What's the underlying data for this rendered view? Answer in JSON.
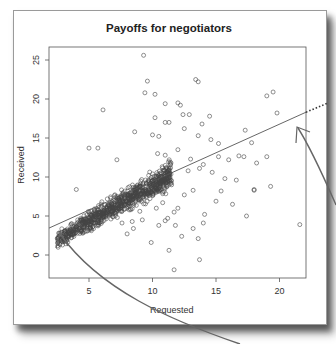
{
  "chart_data": {
    "type": "scatter",
    "title": "Payoffs for negotiators",
    "xlabel": "Requested",
    "ylabel": "Received",
    "xlim": [
      1.85,
      22.2
    ],
    "ylim": [
      -3,
      26.5
    ],
    "x_ticks": [
      5,
      10,
      15,
      20
    ],
    "y_ticks": [
      0,
      5,
      10,
      15,
      20,
      25
    ],
    "grid": false,
    "legend": null,
    "regression_line": {
      "slope": 0.73,
      "intercept": 2.1,
      "extended_dotted": true
    },
    "annotations": [
      {
        "type": "arrow",
        "points_to": "regression line left end",
        "at": [
          2.8,
          3.0
        ]
      },
      {
        "type": "arrow",
        "points_to": "regression line right end",
        "at": [
          21.5,
          16.3
        ]
      }
    ],
    "cluster": {
      "description": "dense band of ~900 points along regression line",
      "x_range": [
        2.5,
        11.5
      ],
      "slope": 0.95,
      "intercept": -0.5,
      "spread": 0.55,
      "count": 900
    },
    "outliers": [
      [
        9.3,
        25.6
      ],
      [
        6.1,
        18.6
      ],
      [
        5.0,
        13.7
      ],
      [
        5.7,
        13.7
      ],
      [
        7.2,
        12.2
      ],
      [
        9.6,
        22.3
      ],
      [
        9.4,
        20.8
      ],
      [
        10.2,
        20.6
      ],
      [
        11.0,
        19.4
      ],
      [
        12.0,
        19.5
      ],
      [
        12.2,
        19.2
      ],
      [
        13.4,
        22.5
      ],
      [
        13.6,
        22.2
      ],
      [
        19.5,
        20.9
      ],
      [
        19.0,
        20.4
      ],
      [
        19.8,
        18.2
      ],
      [
        12.4,
        18.0
      ],
      [
        12.9,
        18.0
      ],
      [
        13.9,
        16.8
      ],
      [
        14.5,
        17.8
      ],
      [
        11.0,
        17.0
      ],
      [
        11.3,
        17.0
      ],
      [
        10.2,
        17.6
      ],
      [
        8.6,
        15.8
      ],
      [
        10.0,
        15.4
      ],
      [
        10.5,
        15.2
      ],
      [
        12.5,
        16.2
      ],
      [
        13.6,
        15.3
      ],
      [
        14.6,
        14.8
      ],
      [
        15.2,
        14.3
      ],
      [
        17.3,
        16.0
      ],
      [
        17.8,
        14.4
      ],
      [
        15.2,
        12.6
      ],
      [
        16.0,
        12.2
      ],
      [
        16.8,
        12.7
      ],
      [
        17.2,
        12.6
      ],
      [
        18.2,
        11.8
      ],
      [
        19.0,
        12.6
      ],
      [
        10.4,
        13.0
      ],
      [
        11.0,
        12.8
      ],
      [
        12.0,
        13.5
      ],
      [
        13.0,
        12.3
      ],
      [
        14.0,
        11.6
      ],
      [
        14.7,
        10.6
      ],
      [
        15.7,
        9.8
      ],
      [
        16.6,
        9.6
      ],
      [
        18.0,
        8.3
      ],
      [
        18.0,
        8.4
      ],
      [
        19.3,
        8.8
      ],
      [
        21.6,
        3.9
      ],
      [
        15.0,
        6.9
      ],
      [
        15.4,
        8.2
      ],
      [
        13.2,
        8.3
      ],
      [
        12.5,
        7.7
      ],
      [
        12.0,
        6.0
      ],
      [
        11.7,
        5.5
      ],
      [
        11.8,
        3.8
      ],
      [
        11.2,
        4.7
      ],
      [
        12.3,
        2.4
      ],
      [
        11.3,
        0.6
      ],
      [
        10.3,
        6.0
      ],
      [
        9.2,
        4.5
      ],
      [
        8.5,
        3.4
      ],
      [
        8.0,
        2.7
      ],
      [
        9.9,
        1.6
      ],
      [
        13.7,
        -0.6
      ],
      [
        10.5,
        3.8
      ],
      [
        8.4,
        4.3
      ],
      [
        7.6,
        4.1
      ],
      [
        4.5,
        2.8
      ],
      [
        4.0,
        8.4
      ],
      [
        11.7,
        -1.9
      ],
      [
        13.6,
        2.1
      ],
      [
        14.1,
        5.2
      ],
      [
        11.0,
        4.4
      ],
      [
        9.0,
        5.6
      ],
      [
        10.8,
        6.7
      ],
      [
        12.8,
        10.8
      ],
      [
        13.7,
        11.1
      ],
      [
        16.3,
        6.5
      ],
      [
        17.4,
        5.0
      ],
      [
        14.0,
        4.1
      ],
      [
        13.2,
        3.4
      ],
      [
        11.5,
        9.0
      ]
    ]
  },
  "colors": {
    "point": "#444444",
    "axis": "#555555",
    "line": "#555555",
    "annotation": "#666666"
  }
}
